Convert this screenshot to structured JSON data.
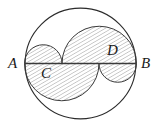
{
  "figure": {
    "background_color": "#ffffff",
    "stroke_color": "#2b2b2b",
    "hatch_color": "#8a8a8a",
    "label_color": "#1a1a1a",
    "width": 162,
    "height": 129
  },
  "circle": {
    "name": "outer-circle",
    "center_x": 80.5,
    "center_y": 63.5,
    "radius": 56,
    "stroke_width": 1.1,
    "fill": "none"
  },
  "diameter": {
    "name": "segment-AB",
    "x1": 24.5,
    "y1": 63.5,
    "x2": 136.5,
    "y2": 63.5,
    "stroke_width": 1.4
  },
  "points": {
    "A": {
      "label": "A",
      "x": 24.5,
      "y": 63.5,
      "label_x": 8,
      "label_y": 57
    },
    "B": {
      "label": "B",
      "x": 136.5,
      "y": 63.5,
      "label_x": 140,
      "label_y": 57
    },
    "C": {
      "label": "C",
      "x": 62.0,
      "y": 63.5,
      "label_x": 41,
      "label_y": 67
    },
    "D": {
      "label": "D",
      "x": 99.0,
      "y": 63.5,
      "label_x": 107,
      "label_y": 44
    }
  },
  "arcs": [
    {
      "name": "arc-AC-upper",
      "description": "semicircle on diameter AC, bulging above line AB, unshaded",
      "from_x": 24.5,
      "to_x": 62.0,
      "radius": 18.75,
      "side": "upper"
    },
    {
      "name": "arc-CB-upper",
      "description": "semicircle on diameter CB, bulging above line AB, upper boundary of shaded region",
      "from_x": 62.0,
      "to_x": 136.5,
      "radius": 37.25,
      "side": "upper"
    },
    {
      "name": "arc-AD-lower",
      "description": "semicircle on diameter AD, bulging below line AB, lower boundary of shaded region",
      "from_x": 24.5,
      "to_x": 99.0,
      "radius": 37.25,
      "side": "lower"
    },
    {
      "name": "arc-DB-lower",
      "description": "semicircle on diameter DB, bulging below line AB, unshaded",
      "from_x": 99.0,
      "to_x": 136.5,
      "radius": 18.75,
      "side": "lower"
    }
  ],
  "shaded_region": {
    "name": "hatched-s-region",
    "pattern": "diagonal-hatch",
    "hatch_angle_degrees": 60,
    "hatch_spacing": 3.2,
    "description": "S-shaped region bounded above by arc CB and arc AC, below by arc AD and arc DB"
  }
}
